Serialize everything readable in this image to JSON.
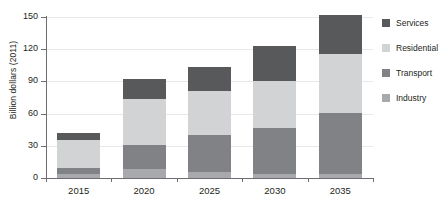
{
  "chart_data": {
    "type": "bar",
    "title": "",
    "subtitle": "",
    "xlabel": "",
    "ylabel": "Billion dollars (2011)",
    "categories": [
      "2015",
      "2020",
      "2025",
      "2030",
      "2035"
    ],
    "series": [
      {
        "name": "Industry",
        "color": "#a7a9ac",
        "values": [
          4,
          8,
          6,
          4,
          4
        ]
      },
      {
        "name": "Transport",
        "color": "#808285",
        "values": [
          5,
          23,
          34,
          43,
          57
        ]
      },
      {
        "name": "Residential",
        "color": "#d1d3d4",
        "values": [
          26,
          43,
          41,
          43,
          55
        ]
      },
      {
        "name": "Services",
        "color": "#58595b",
        "values": [
          7,
          18,
          22,
          33,
          36
        ]
      }
    ],
    "totals": [
      42,
      92,
      103,
      123,
      152
    ],
    "stacked": true,
    "yticks": [
      0,
      30,
      60,
      90,
      120,
      150
    ],
    "ylim": [
      0,
      150
    ],
    "grid": true,
    "legend_position": "right",
    "legend_entries": [
      "Services",
      "Residential",
      "Transport",
      "Industry"
    ],
    "axis_color": "#6d6e71",
    "grid_color": "#e8e8e8",
    "background": "#ffffff"
  }
}
